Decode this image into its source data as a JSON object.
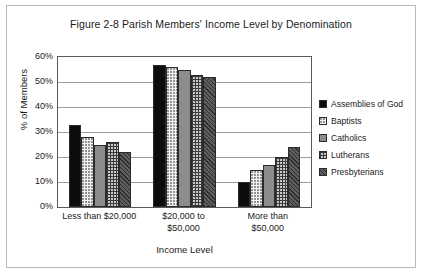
{
  "chart_data": {
    "type": "bar",
    "title": "Figure 2-8 Parish Members' Income Level by Denomination",
    "xlabel": "Income Level",
    "ylabel": "% of Members",
    "categories": [
      "Less than $20,000",
      "$20,000 to $50,000",
      "More than $50,000"
    ],
    "category_lines": [
      [
        "Less than $20,000"
      ],
      [
        "$20,000 to",
        "$50,000"
      ],
      [
        "More than",
        "$50,000"
      ]
    ],
    "series": [
      {
        "name": "Assemblies of God",
        "values": [
          33,
          57,
          10
        ],
        "pattern": "solid-black"
      },
      {
        "name": "Baptists",
        "values": [
          28,
          56,
          15
        ],
        "pattern": "white-dots"
      },
      {
        "name": "Catholics",
        "values": [
          25,
          55,
          17
        ],
        "pattern": "solid-gray"
      },
      {
        "name": "Lutherans",
        "values": [
          26,
          53,
          20
        ],
        "pattern": "grid"
      },
      {
        "name": "Presbyterians",
        "values": [
          22,
          52,
          24
        ],
        "pattern": "diag-dark"
      }
    ],
    "ylim": [
      0,
      60
    ],
    "yticks": [
      0,
      10,
      20,
      30,
      40,
      50,
      60
    ],
    "ytick_labels": [
      "0%",
      "10%",
      "20%",
      "30%",
      "40%",
      "50%",
      "60%"
    ],
    "grid": true,
    "legend_position": "right"
  }
}
